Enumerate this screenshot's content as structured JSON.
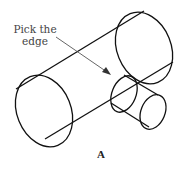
{
  "diagram": {
    "label_line1": "Pick the",
    "label_line2": "edge",
    "caption": "A",
    "stroke_color": "#111111",
    "arrow_color": "#555555"
  }
}
